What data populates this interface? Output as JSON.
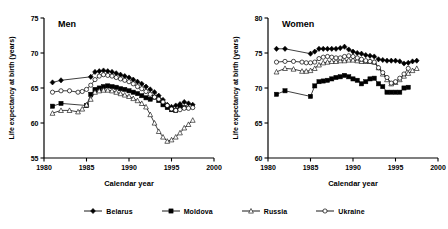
{
  "chart_data": [
    {
      "type": "line",
      "title": "Men",
      "xlabel": "Calendar year",
      "ylabel": "Life expectancy at birth (years)",
      "xlim": [
        1980,
        2000
      ],
      "ylim": [
        55,
        75
      ],
      "xticks": [
        1980,
        1985,
        1990,
        1995,
        2000
      ],
      "yticks": [
        55,
        60,
        65,
        70,
        75
      ],
      "grid": false,
      "legend_position": "below-figure",
      "series": [
        {
          "name": "Belarus",
          "marker": "filled-diamond",
          "x": [
            1981,
            1982,
            1985.5,
            1986,
            1986.5,
            1987,
            1987.5,
            1988,
            1988.5,
            1989,
            1989.5,
            1990,
            1990.5,
            1991,
            1991.5,
            1992,
            1992.5,
            1993,
            1993.5,
            1994,
            1994.5,
            1995,
            1995.5,
            1996,
            1996.5,
            1997,
            1997.5
          ],
          "y": [
            65.8,
            66.1,
            66.6,
            67.3,
            67.4,
            67.5,
            67.4,
            67.3,
            67.1,
            66.9,
            66.7,
            66.5,
            66.2,
            65.9,
            65.6,
            65.2,
            64.8,
            64.4,
            63.9,
            63.3,
            62.6,
            62.3,
            62.5,
            62.7,
            63.0,
            62.8,
            62.6
          ]
        },
        {
          "name": "Moldova",
          "marker": "filled-square",
          "x": [
            1981,
            1982,
            1985,
            1985.5,
            1986,
            1986.5,
            1987,
            1987.5,
            1988,
            1988.5,
            1989,
            1989.5,
            1990,
            1990.5,
            1991,
            1991.5,
            1992,
            1992.5,
            1993,
            1993.5,
            1994,
            1994.5,
            1995,
            1995.5,
            1996,
            1996.5
          ],
          "y": [
            62.4,
            62.8,
            62.5,
            64.1,
            64.8,
            65.0,
            65.2,
            65.3,
            65.2,
            65.1,
            64.9,
            64.8,
            64.6,
            64.4,
            64.2,
            63.9,
            63.6,
            63.4,
            63.7,
            63.2,
            62.6,
            62.2,
            61.9,
            61.8,
            62.3,
            62.2
          ]
        },
        {
          "name": "Russia",
          "marker": "open-triangle",
          "x": [
            1981,
            1982,
            1983,
            1984,
            1984.5,
            1985,
            1985.5,
            1986,
            1986.5,
            1987,
            1987.5,
            1988,
            1988.5,
            1989,
            1989.5,
            1990,
            1990.5,
            1991,
            1991.5,
            1992,
            1992.5,
            1993,
            1993.5,
            1994,
            1994.5,
            1995,
            1995.5,
            1996,
            1996.5,
            1997,
            1997.5
          ],
          "y": [
            61.4,
            61.8,
            61.8,
            61.6,
            62.0,
            62.6,
            63.4,
            64.4,
            64.6,
            64.7,
            64.7,
            64.6,
            64.4,
            64.2,
            64.0,
            63.8,
            63.5,
            63.2,
            62.8,
            62.3,
            61.2,
            60.0,
            58.8,
            58.0,
            57.4,
            57.6,
            58.0,
            58.6,
            59.3,
            59.8,
            60.4
          ]
        },
        {
          "name": "Ukraine",
          "marker": "open-circle",
          "x": [
            1981,
            1982,
            1983,
            1984,
            1984.5,
            1985,
            1985.5,
            1986,
            1986.5,
            1987,
            1987.5,
            1988,
            1988.5,
            1989,
            1989.5,
            1990,
            1990.5,
            1991,
            1991.5,
            1992,
            1992.5,
            1993,
            1993.5,
            1994,
            1994.5,
            1995,
            1995.5,
            1996,
            1996.5,
            1997,
            1997.5
          ],
          "y": [
            64.4,
            64.6,
            64.6,
            64.4,
            64.5,
            64.8,
            65.4,
            66.2,
            66.7,
            66.9,
            66.8,
            66.7,
            66.5,
            66.3,
            66.1,
            65.9,
            65.6,
            65.2,
            64.9,
            64.5,
            64.1,
            63.7,
            63.4,
            63.0,
            62.5,
            62.0,
            61.8,
            61.9,
            62.1,
            62.1,
            62.2
          ]
        }
      ]
    },
    {
      "type": "line",
      "title": "Women",
      "xlabel": "Calendar year",
      "ylabel": "Life expectancy at birth (years)",
      "xlim": [
        1980,
        2000
      ],
      "ylim": [
        60,
        80
      ],
      "xticks": [
        1980,
        1985,
        1990,
        1995,
        2000
      ],
      "yticks": [
        60,
        65,
        70,
        75,
        80
      ],
      "grid": false,
      "legend_position": "below-figure",
      "series": [
        {
          "name": "Belarus",
          "marker": "filled-diamond",
          "x": [
            1981,
            1982,
            1985,
            1985.5,
            1986,
            1986.5,
            1987,
            1987.5,
            1988,
            1988.5,
            1989,
            1989.5,
            1990,
            1990.5,
            1991,
            1991.5,
            1992,
            1992.5,
            1993,
            1993.5,
            1994,
            1994.5,
            1995,
            1995.5,
            1996,
            1996.5,
            1997,
            1997.5
          ],
          "y": [
            75.6,
            75.6,
            74.9,
            75.2,
            75.6,
            75.6,
            75.6,
            75.6,
            75.6,
            75.7,
            75.9,
            75.5,
            75.2,
            75.0,
            74.9,
            74.7,
            74.6,
            74.5,
            74.1,
            74.0,
            73.9,
            73.9,
            73.9,
            73.8,
            73.5,
            73.6,
            73.8,
            73.9
          ]
        },
        {
          "name": "Moldova",
          "marker": "filled-square",
          "x": [
            1981,
            1982,
            1985,
            1985.5,
            1986,
            1986.5,
            1987,
            1987.5,
            1988,
            1988.5,
            1989,
            1989.5,
            1990,
            1990.5,
            1991,
            1991.5,
            1992,
            1992.5,
            1993,
            1993.5,
            1994,
            1994.5,
            1995,
            1995.5,
            1996,
            1996.5
          ],
          "y": [
            69.1,
            69.6,
            68.8,
            70.3,
            70.9,
            71.0,
            71.1,
            71.3,
            71.5,
            71.6,
            71.8,
            71.6,
            71.3,
            71.1,
            70.6,
            70.9,
            71.3,
            71.4,
            70.6,
            70.2,
            69.4,
            69.4,
            69.4,
            69.4,
            70.0,
            70.1
          ]
        },
        {
          "name": "Russia",
          "marker": "open-triangle",
          "x": [
            1981,
            1982,
            1983,
            1984,
            1984.5,
            1985,
            1985.5,
            1986,
            1986.5,
            1987,
            1987.5,
            1988,
            1988.5,
            1989,
            1989.5,
            1990,
            1990.5,
            1991,
            1991.5,
            1992,
            1992.5,
            1993,
            1993.5,
            1994,
            1994.5,
            1995,
            1995.5,
            1996,
            1996.5,
            1997,
            1997.5
          ],
          "y": [
            72.3,
            72.8,
            72.7,
            72.4,
            72.4,
            72.5,
            72.8,
            73.3,
            73.6,
            73.7,
            73.8,
            73.8,
            73.9,
            73.9,
            74.0,
            74.0,
            73.9,
            73.8,
            73.8,
            73.8,
            73.7,
            72.9,
            72.0,
            71.2,
            70.6,
            70.8,
            71.2,
            71.7,
            72.1,
            72.5,
            72.8
          ]
        },
        {
          "name": "Ukraine",
          "marker": "open-circle",
          "x": [
            1981,
            1982,
            1983,
            1984,
            1984.5,
            1985,
            1985.5,
            1986,
            1986.5,
            1987,
            1987.5,
            1988,
            1988.5,
            1989,
            1989.5,
            1990,
            1990.5,
            1991,
            1991.5,
            1992,
            1992.5,
            1993,
            1993.5,
            1994,
            1994.5,
            1995,
            1995.5,
            1996,
            1996.5
          ],
          "y": [
            73.7,
            73.8,
            73.8,
            73.7,
            73.6,
            73.6,
            73.7,
            74.2,
            74.4,
            74.5,
            74.4,
            74.3,
            74.3,
            74.5,
            74.6,
            74.5,
            74.3,
            74.1,
            73.9,
            73.8,
            73.7,
            72.9,
            72.2,
            71.5,
            70.7,
            70.9,
            71.4,
            72.0,
            72.8
          ]
        }
      ]
    }
  ],
  "legend": {
    "items": [
      {
        "label": "Belarus",
        "marker": "filled-diamond"
      },
      {
        "label": "Moldova",
        "marker": "filled-square"
      },
      {
        "label": "Russia",
        "marker": "open-triangle"
      },
      {
        "label": "Ukraine",
        "marker": "open-circle"
      }
    ]
  },
  "style": {
    "line_color": "#000000",
    "axis_color": "#000000",
    "background": "#ffffff"
  }
}
